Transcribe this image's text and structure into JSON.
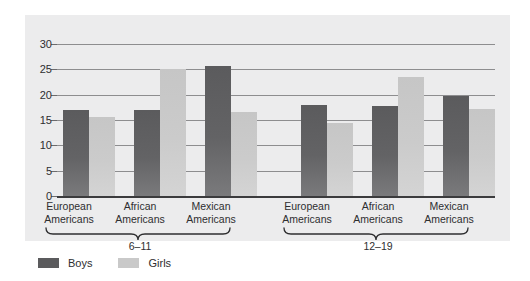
{
  "chart_data": {
    "type": "bar",
    "title": "",
    "subtitle": "",
    "xlabel": "",
    "ylabel": "",
    "ylim": [
      0,
      30
    ],
    "yticks": [
      0,
      5,
      10,
      15,
      20,
      25,
      30
    ],
    "ytick_labels": [
      "0",
      "5",
      "10",
      "15",
      "20",
      "25",
      "30"
    ],
    "grid": true,
    "legend_position": "bottom-left",
    "categories": [
      "European Americans",
      "African Americans",
      "Mexican Americans",
      "European Americans",
      "African Americans",
      "Mexican Americans"
    ],
    "groups": [
      {
        "label": "6–11",
        "categories": [
          "European Americans",
          "African Americans",
          "Mexican Americans"
        ]
      },
      {
        "label": "12–19",
        "categories": [
          "European Americans",
          "African Americans",
          "Mexican Americans"
        ]
      }
    ],
    "series": [
      {
        "name": "Boys",
        "color": "#5b5b5d",
        "values": [
          17.0,
          16.9,
          25.6,
          17.9,
          17.8,
          19.8
        ]
      },
      {
        "name": "Girls",
        "color": "#c9c9c9",
        "values": [
          15.5,
          25.0,
          16.6,
          14.4,
          23.5,
          17.1
        ]
      }
    ]
  },
  "axis": {
    "ytick_labels": [
      "30",
      "25",
      "20",
      "15",
      "10",
      "5",
      "0"
    ]
  },
  "categories": {
    "c0_line1": "European",
    "c0_line2": "Americans",
    "c1_line1": "African",
    "c1_line2": "Americans",
    "c2_line1": "Mexican",
    "c2_line2": "Americans",
    "c3_line1": "European",
    "c3_line2": "Americans",
    "c4_line1": "African",
    "c4_line2": "Americans",
    "c5_line1": "Mexican",
    "c5_line2": "Americans"
  },
  "groups": {
    "g0_label": "6–11",
    "g1_label": "12–19"
  },
  "legend": {
    "boys_label": "Boys",
    "girls_label": "Girls"
  }
}
